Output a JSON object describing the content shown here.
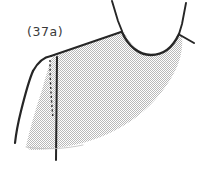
{
  "figure": {
    "label": "(37a)",
    "kind": "technical-fashion-illustration",
    "colors": {
      "background": "#ffffff",
      "outline": "#262626",
      "dash_line": "#2b2b2b",
      "fill_stipple": "#c9c9c9",
      "label_text": "#3a3a3a"
    },
    "parts": [
      {
        "name": "left-shoulder-strap",
        "style": "solid"
      },
      {
        "name": "right-shoulder-strap",
        "style": "solid"
      },
      {
        "name": "neckline-curve",
        "style": "solid"
      },
      {
        "name": "upper-back-edge",
        "style": "solid"
      },
      {
        "name": "left-armhole-edge",
        "style": "solid"
      },
      {
        "name": "side-seam",
        "style": "solid"
      },
      {
        "name": "dart-guide",
        "style": "dashed"
      },
      {
        "name": "body-panel",
        "style": "stippled-fill"
      },
      {
        "name": "hem-edge",
        "style": "shaded"
      }
    ]
  }
}
